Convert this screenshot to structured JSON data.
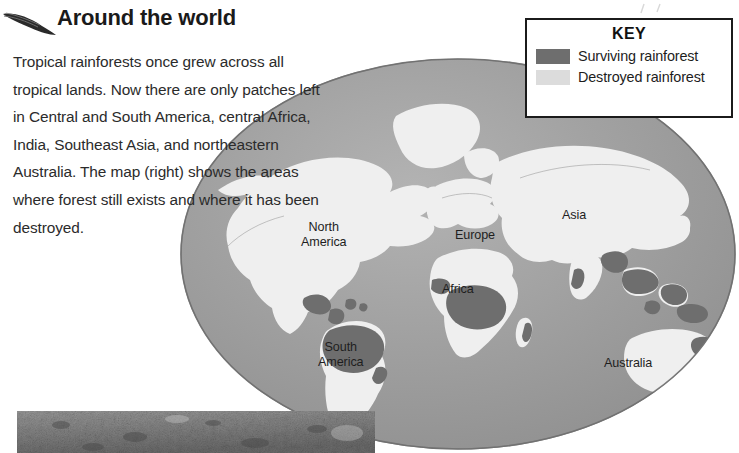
{
  "article": {
    "headline": "Around the world",
    "body": "Tropical rainforests once grew across all tropical lands. Now there are only patches left in Central and South America, central Africa, India, Southeast Asia, and northeastern Australia. The map (right) shows the areas where forest still exists and where it has been destroyed."
  },
  "key": {
    "title": "KEY",
    "items": [
      {
        "label": "Surviving rainforest",
        "color": "#6e6e6e"
      },
      {
        "label": "Destroyed rainforest",
        "color": "#dcdcdc"
      }
    ]
  },
  "map": {
    "labels": [
      {
        "id": "north-america",
        "text": "North\nAmerica"
      },
      {
        "id": "south-america",
        "text": "South\nAmerica"
      },
      {
        "id": "europe",
        "text": "Europe"
      },
      {
        "id": "africa",
        "text": "Africa"
      },
      {
        "id": "asia",
        "text": "Asia"
      },
      {
        "id": "australia",
        "text": "Australia"
      }
    ],
    "ocean_color": "#9a9a9a",
    "surviving_color": "#6e6e6e",
    "destroyed_color": "#efefef",
    "outline_color": "#5c5c5c"
  },
  "decorations": {
    "leaf_icon": "leaf-icon",
    "photo_caption": ""
  }
}
